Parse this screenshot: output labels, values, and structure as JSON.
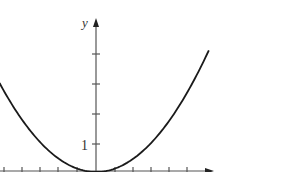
{
  "chart_data": {
    "type": "line",
    "title": "",
    "xlabel": "",
    "ylabel": "y",
    "y_tick_labels": [
      "1"
    ],
    "y_ticks": [
      1,
      2,
      3,
      4
    ],
    "x_ticks": [
      -5,
      -4,
      -3,
      -2,
      -1,
      1,
      2,
      3,
      4,
      5
    ],
    "xlim": [
      -5.3,
      6.2
    ],
    "ylim": [
      0,
      5
    ],
    "grid": false,
    "legend": null,
    "series": [
      {
        "name": "parabola",
        "function": "y = x^2 / 9",
        "x": [
          -5.3,
          -4,
          -3,
          -2,
          -1,
          0,
          1,
          2,
          3,
          4,
          5,
          6.2
        ],
        "y": [
          3.12,
          1.78,
          1.0,
          0.44,
          0.11,
          0,
          0.11,
          0.44,
          1.0,
          1.78,
          2.78,
          4.27
        ]
      }
    ],
    "colors": {
      "curve": "#1a1a1a",
      "axes": "#555555"
    }
  },
  "labels": {
    "y_axis": "y",
    "y_tick_one": "1"
  }
}
